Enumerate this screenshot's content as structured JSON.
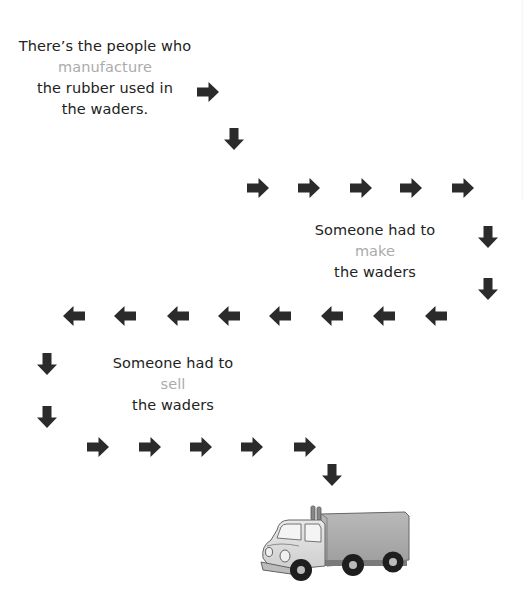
{
  "colors": {
    "text": "#222222",
    "highlight": "#ababab",
    "arrow": "#2b2b2b",
    "background": "#ffffff"
  },
  "steps": [
    {
      "line1": "There’s the people who",
      "highlight": "manufacture",
      "line3": "the rubber used in",
      "line4": "the waders."
    },
    {
      "line1": "Someone had to",
      "highlight": "make",
      "line3": "the waders"
    },
    {
      "line1": "Someone had to",
      "highlight": "sell",
      "line3": "the waders"
    }
  ],
  "path": {
    "arrow_icon": "arrow-icon",
    "sequence": [
      "right",
      "down",
      "right",
      "right",
      "right",
      "right",
      "right",
      "down",
      "down",
      "left",
      "left",
      "left",
      "left",
      "left",
      "left",
      "left",
      "left",
      "down",
      "down",
      "right",
      "right",
      "right",
      "right",
      "right",
      "down"
    ]
  },
  "illustration": {
    "icon": "delivery-truck-icon",
    "label": "delivery truck"
  }
}
